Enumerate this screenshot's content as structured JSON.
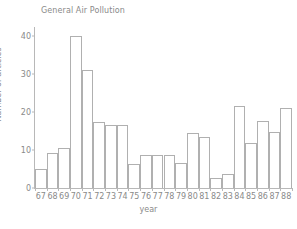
{
  "chart_data": {
    "type": "bar",
    "title": "General Air Pollution",
    "xlabel": "year",
    "ylabel": "Number of articles",
    "categories": [
      "67",
      "68",
      "69",
      "70",
      "71",
      "72",
      "73",
      "74",
      "75",
      "76",
      "77",
      "78",
      "79",
      "80",
      "81",
      "82",
      "83",
      "84",
      "85",
      "86",
      "87",
      "88"
    ],
    "values": [
      5,
      9.3,
      10.4,
      40,
      31,
      17.2,
      16.5,
      16.5,
      6.3,
      8.7,
      8.7,
      8.7,
      6.6,
      14.5,
      13.5,
      2.6,
      3.7,
      21.5,
      11.7,
      17.5,
      14.7,
      21
    ],
    "ylim": [
      0,
      42
    ],
    "yticks": [
      0,
      10,
      20,
      30,
      40
    ],
    "ytick_labels": [
      "0",
      "10",
      "20",
      "30",
      "40"
    ],
    "grid": false,
    "legend": "none",
    "bar_fill": "#ffffff",
    "bar_edge": "#b0b0b0",
    "axis_color": "#b8b8b8",
    "text_color": "#8a8a8a"
  }
}
